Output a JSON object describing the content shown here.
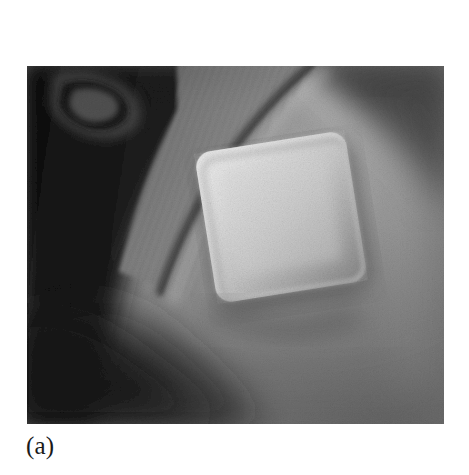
{
  "figure": {
    "caption": "(a)",
    "photo": {
      "alt_description": "Close-up grayscale photograph of a human upper arm with a rolled-up ribbed knit sleeve, showing a square adhesive transdermal patch applied to the skin",
      "frame": {
        "x": 27,
        "y": 66,
        "width": 417,
        "height": 358
      },
      "subjects": [
        {
          "name": "upper-arm-skin",
          "tone": "#8d8d8d"
        },
        {
          "name": "ribbed-sleeve",
          "tone": "#7b7b7b"
        },
        {
          "name": "sleeve-hem-highlight",
          "tone": "#c9c9c9"
        },
        {
          "name": "adhesive-patch",
          "tone": "#c6c6c6"
        },
        {
          "name": "patch-shadow",
          "tone": "#5c5c5c"
        },
        {
          "name": "background-shadow-left",
          "tone": "#1e1e1e"
        },
        {
          "name": "background-shadow-top-right",
          "tone": "#4a4a4a"
        }
      ],
      "patch": {
        "label": "square adhesive patch",
        "rotation_deg": -9,
        "corner_radius": 16,
        "bounds": {
          "x": 178,
          "y": 75,
          "width": 152,
          "height": 152
        }
      },
      "palette": {
        "page_background": "#ffffff",
        "caption_color": "#1a1a1a",
        "skin_mid": "#8d8d8d",
        "skin_light": "#a6a6a6",
        "skin_dark": "#5a5a5a",
        "patch_light": "#d2d2d2",
        "patch_mid": "#bdbdbd",
        "shadow_deep": "#121212"
      }
    }
  }
}
